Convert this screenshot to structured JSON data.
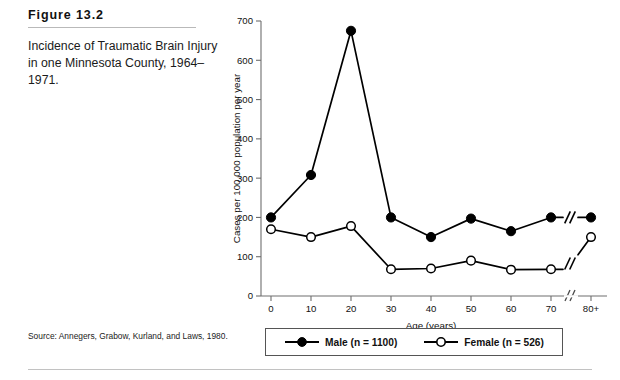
{
  "caption": {
    "figure_number": "Figure 13.2",
    "text": "Incidence of Traumatic Brain Injury in one Minnesota County, 1964–1971."
  },
  "source": {
    "text": "Source: Annegers, Grabow, Kurland, and Laws, 1980."
  },
  "legend": {
    "male_label": "Male (n = 1100)",
    "female_label": "Female (n = 526)"
  },
  "chart_data": {
    "type": "line",
    "title": "",
    "xlabel": "Age (years)",
    "ylabel": "Cases per 100,000 population per year",
    "categories": [
      "0",
      "10",
      "20",
      "30",
      "40",
      "50",
      "60",
      "70",
      "80+"
    ],
    "x_tick_labels": [
      "0",
      "10",
      "20",
      "30",
      "40",
      "50",
      "60",
      "70",
      "80+"
    ],
    "y_tick_labels": [
      "0",
      "100",
      "200",
      "300",
      "400",
      "500",
      "600",
      "700"
    ],
    "y_ticks": [
      0,
      100,
      200,
      300,
      400,
      500,
      600,
      700
    ],
    "ylim": [
      0,
      700
    ],
    "grid": false,
    "legend_position": "below",
    "axis_break": {
      "between": [
        "70",
        "80+"
      ],
      "symbol": "//"
    },
    "series": [
      {
        "name": "Male (n = 1100)",
        "marker": "filled-circle",
        "color": "#000000",
        "values": [
          200,
          308,
          675,
          200,
          150,
          197,
          165,
          200,
          200
        ]
      },
      {
        "name": "Female (n = 526)",
        "marker": "open-circle",
        "color": "#000000",
        "values": [
          170,
          150,
          178,
          68,
          70,
          90,
          67,
          68,
          150
        ]
      }
    ]
  }
}
